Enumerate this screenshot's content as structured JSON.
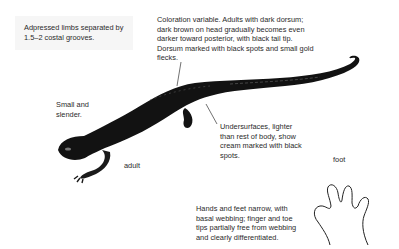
{
  "annotations": {
    "limbs": "Adpressed limbs separated by 1.5–2 costal grooves.",
    "coloration": "Coloration variable. Adults with dark dorsum; dark brown on head gradually becomes even darker toward posterior, with black tail tip. Dorsum marked with black spots and small gold flecks.",
    "size": "Small and slender.",
    "undersurfaces": "Undersurfaces, lighter than rest of body, show cream marked with black spots.",
    "feet": "Hands and feet narrow, with basal webbing; finger and toe tips partially free from webbing and clearly differentiated."
  },
  "labels": {
    "adult": "adult",
    "foot": "foot"
  },
  "colors": {
    "body": "#111111",
    "text": "#2a2a2a",
    "box": "#f6f6f6"
  }
}
